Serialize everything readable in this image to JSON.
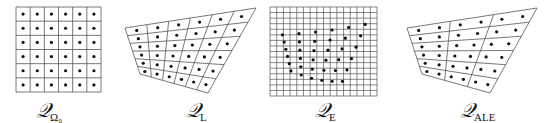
{
  "figure": {
    "panels": [
      {
        "id": "omega0",
        "label_main": "𝒬",
        "label_sub": "Ω₀",
        "type": "uniform-square-grid",
        "rows": 6,
        "cols": 6,
        "bounds": {
          "x0": 16,
          "y0": 7,
          "x1": 101,
          "y1": 92
        },
        "label_pos": {
          "x": 36,
          "y": 98
        }
      },
      {
        "id": "lagrangian",
        "label_main": "𝒬",
        "label_sub": "L",
        "type": "deformed-quad-mesh",
        "rows": 6,
        "cols": 6,
        "corners": {
          "tl": [
            125,
            28
          ],
          "tr": [
            256,
            8
          ],
          "br": [
            208,
            93
          ],
          "bl": [
            140,
            74
          ]
        },
        "label_pos": {
          "x": 186,
          "y": 98
        }
      },
      {
        "id": "eulerian",
        "label_main": "𝒬",
        "label_sub": "E",
        "type": "fine-grid-with-scattered-points",
        "rows": 16,
        "cols": 16,
        "bounds": {
          "x0": 270,
          "y0": 7,
          "x1": 377,
          "y1": 96
        },
        "label_pos": {
          "x": 315,
          "y": 98
        }
      },
      {
        "id": "ale",
        "label_main": "𝒬",
        "label_sub": "ALE",
        "type": "coarse-ale-mesh",
        "rows": 6,
        "cols": 3,
        "particle_cols": 6,
        "corners": {
          "tl": [
            407,
            28
          ],
          "tr": [
            537,
            8
          ],
          "br": [
            490,
            93
          ],
          "bl": [
            422,
            74
          ]
        },
        "label_pos": {
          "x": 460,
          "y": 98
        }
      }
    ],
    "colors": {
      "line": "#555555",
      "dot": "#111111",
      "background": "#ffffff"
    }
  }
}
